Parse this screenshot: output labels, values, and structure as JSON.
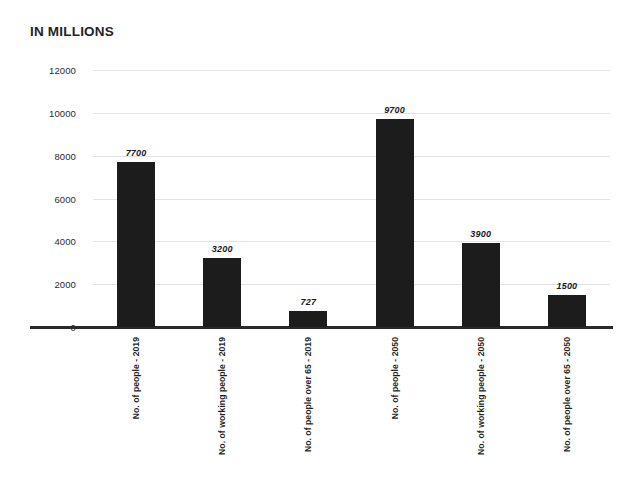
{
  "chart_data": {
    "type": "bar",
    "title": "IN MILLIONS",
    "xlabel": "",
    "ylabel": "",
    "ylim": [
      0,
      12000
    ],
    "ytick_step": 2000,
    "yticks": [
      "12000",
      "10000",
      "8000",
      "6000",
      "4000",
      "2000",
      "0"
    ],
    "ytick_values": [
      12000,
      10000,
      8000,
      6000,
      4000,
      2000,
      0
    ],
    "grid": true,
    "legend": false,
    "bar_color": "#1c1c1c",
    "gridline_color": "#e3e3e3",
    "axis_color": "#2a2a2a",
    "categories": [
      "No. of people - 2019",
      "No. of working people - 2019",
      "No. of people over 65 - 2019",
      "No. of people - 2050",
      "No. of working people - 2050",
      "No. of people over 65 - 2050"
    ],
    "values": [
      7700,
      3200,
      727,
      9700,
      3900,
      1500
    ],
    "value_labels": [
      "7700",
      "3200",
      "727",
      "9700",
      "3900",
      "1500"
    ]
  }
}
